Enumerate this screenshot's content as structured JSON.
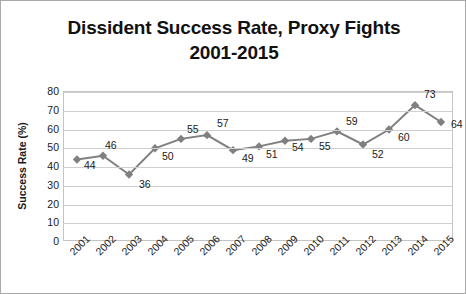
{
  "chart_data": {
    "type": "line",
    "title": "Dissident Success Rate, Proxy Fights 2001-2015",
    "title_lines": [
      "Dissident Success Rate, Proxy Fights",
      "2001-2015"
    ],
    "xlabel": "",
    "ylabel": "Success Rate (%)",
    "ylim": [
      0,
      80
    ],
    "ytick_step": 10,
    "yticks": [
      80,
      70,
      60,
      50,
      40,
      30,
      20,
      10,
      0
    ],
    "grid": "horizontal",
    "legend": "none",
    "marker": "diamond",
    "series_color": "#808080",
    "border_color": "#a9a9a9",
    "gridline_color": "#cfcfcf",
    "categories": [
      "2001",
      "2002",
      "2003",
      "2004",
      "2005",
      "2006",
      "2007",
      "2008",
      "2009",
      "2010",
      "2011",
      "2012",
      "2013",
      "2014",
      "2015"
    ],
    "values": [
      44,
      46,
      36,
      50,
      55,
      57,
      49,
      51,
      54,
      55,
      59,
      52,
      60,
      73,
      64
    ],
    "data_labels": [
      "44",
      "46",
      "36",
      "50",
      "55",
      "57",
      "49",
      "51",
      "54",
      "55",
      "59",
      "52",
      "60",
      "73",
      "64"
    ],
    "series": [
      {
        "name": "Dissident Success Rate",
        "values": [
          44,
          46,
          36,
          50,
          55,
          57,
          49,
          51,
          54,
          55,
          59,
          52,
          60,
          73,
          64
        ]
      }
    ]
  }
}
